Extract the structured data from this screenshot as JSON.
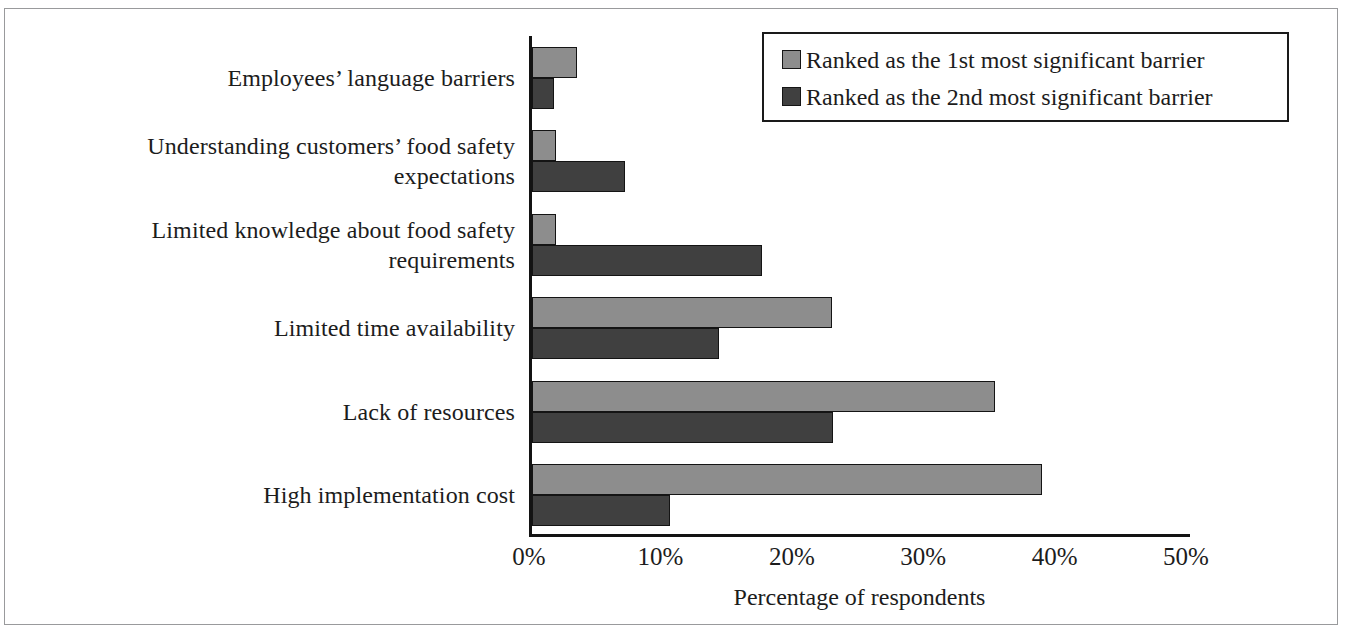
{
  "chart_data": {
    "type": "bar",
    "orientation": "horizontal",
    "title": "",
    "xlabel": "Percentage of respondents",
    "ylabel": "",
    "xlim": [
      0,
      50
    ],
    "xtick_labels": [
      "0%",
      "10%",
      "20%",
      "30%",
      "40%",
      "50%"
    ],
    "xtick_values": [
      0,
      10,
      20,
      30,
      40,
      50
    ],
    "grid": false,
    "legend_position": "top-right",
    "categories": [
      "Employees’ language barriers",
      "Understanding customers’ food safety expectations",
      "Limited knowledge about food safety requirements",
      "Limited time availability",
      "Lack of resources",
      "High implementation cost"
    ],
    "category_lines": [
      [
        "Employees’ language barriers"
      ],
      [
        "Understanding customers’ food safety",
        "expectations"
      ],
      [
        "Limited knowledge about food safety",
        "requirements"
      ],
      [
        "Limited time availability"
      ],
      [
        "Lack of resources"
      ],
      [
        "High implementation cost"
      ]
    ],
    "series": [
      {
        "name": "Ranked as the 1st most significant barrier",
        "color": "#8d8d8d",
        "values": [
          3.4,
          1.8,
          1.8,
          22.8,
          35.2,
          38.8
        ]
      },
      {
        "name": "Ranked as the 2nd most significant barrier",
        "color": "#404040",
        "values": [
          1.7,
          7.1,
          17.5,
          14.2,
          22.9,
          10.5
        ]
      }
    ]
  },
  "legend": {
    "items": [
      {
        "label": "Ranked as the 1st most significant barrier",
        "swatch": "series-1-swatch"
      },
      {
        "label": "Ranked as the 2nd most significant barrier",
        "swatch": "series-2-swatch"
      }
    ]
  },
  "axis": {
    "x_title": "Percentage of respondents",
    "ticks": [
      "0%",
      "10%",
      "20%",
      "30%",
      "40%",
      "50%"
    ]
  }
}
